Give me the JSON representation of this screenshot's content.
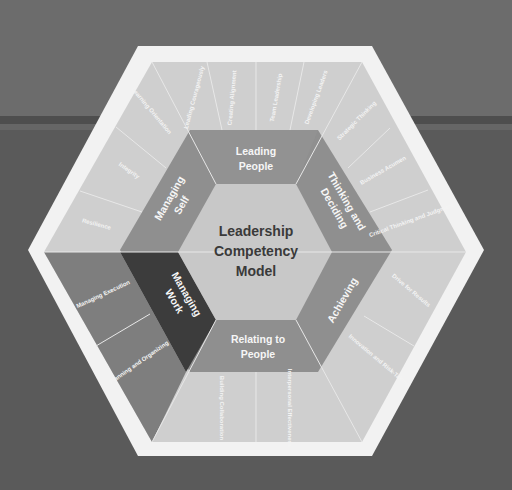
{
  "colors": {
    "background_top": "#6c6c6c",
    "background_bottom": "#5a5a5a",
    "frame": "#f2f2f2",
    "outer_light": "#cfcfcf",
    "outer_dark": "#7e7e7e",
    "mid": "#8f8f8f",
    "mid_dark": "#3c3c3c",
    "center": "#c8c8c8",
    "center_text": "#3a3a3a"
  },
  "center": {
    "line1": "Leadership",
    "line2": "Competency",
    "line3": "Model"
  },
  "categories": [
    {
      "id": "leading-people",
      "line1": "Leading",
      "line2": "People",
      "competencies": [
        "Leading Courageously",
        "Creating Alignment",
        "Team Leadership",
        "Developing Leaders"
      ]
    },
    {
      "id": "thinking-deciding",
      "line1": "Thinking and",
      "line2": "Deciding",
      "competencies": [
        "Strategic Thinking",
        "Business Acumen",
        "Critical Thinking and Judgment"
      ]
    },
    {
      "id": "achieving",
      "line1": "Achieving",
      "line2": "",
      "competencies": [
        "Drive for Results",
        "Innovation and Risk-Taking"
      ]
    },
    {
      "id": "relating-to-people",
      "line1": "Relating to",
      "line2": "People",
      "competencies": [
        "Building Collaboration",
        "Interpersonal Effectiveness"
      ]
    },
    {
      "id": "managing-work",
      "line1": "Managing",
      "line2": "Work",
      "competencies": [
        "Managing Execution",
        "Planning and Organizing"
      ]
    },
    {
      "id": "managing-self",
      "line1": "Managing",
      "line2": "Self",
      "competencies": [
        "Learning Orientation",
        "Integrity",
        "Resilience"
      ]
    }
  ]
}
